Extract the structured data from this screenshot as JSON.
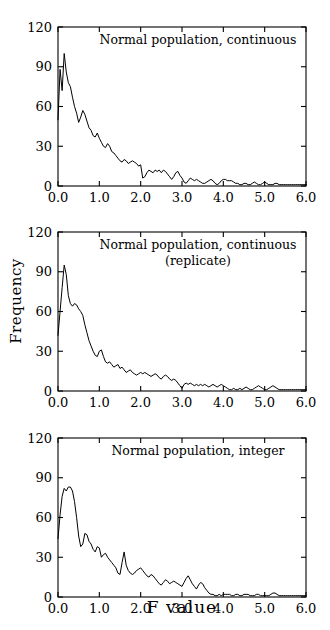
{
  "figure": {
    "xlabel": "F value",
    "ylabel": "Frequency"
  },
  "chart_data": [
    {
      "type": "line",
      "title": "Normal population, continuous",
      "subtitle": "",
      "xlabel": "F value",
      "ylabel": "Frequency",
      "xlim": [
        0.0,
        6.0
      ],
      "ylim": [
        0,
        120
      ],
      "xticks": [
        "0.0",
        "1.0",
        "2.0",
        "3.0",
        "4.0",
        "5.0",
        "6.0"
      ],
      "xtick_values": [
        0.0,
        1.0,
        2.0,
        3.0,
        4.0,
        5.0,
        6.0
      ],
      "yticks": [
        "0",
        "30",
        "60",
        "90",
        "120"
      ],
      "ytick_values": [
        0,
        30,
        60,
        90,
        120
      ],
      "grid": false,
      "legend": false,
      "x": [
        0.0,
        0.05,
        0.1,
        0.15,
        0.2,
        0.25,
        0.3,
        0.35,
        0.4,
        0.45,
        0.5,
        0.55,
        0.6,
        0.65,
        0.7,
        0.75,
        0.8,
        0.85,
        0.9,
        0.95,
        1.0,
        1.05,
        1.1,
        1.15,
        1.2,
        1.25,
        1.3,
        1.35,
        1.4,
        1.45,
        1.5,
        1.55,
        1.6,
        1.65,
        1.7,
        1.75,
        1.8,
        1.85,
        1.9,
        1.95,
        2.0,
        2.05,
        2.1,
        2.15,
        2.2,
        2.25,
        2.3,
        2.35,
        2.4,
        2.45,
        2.5,
        2.55,
        2.6,
        2.65,
        2.7,
        2.75,
        2.8,
        2.85,
        2.9,
        2.95,
        3.0,
        3.05,
        3.1,
        3.15,
        3.2,
        3.25,
        3.3,
        3.35,
        3.4,
        3.45,
        3.5,
        3.55,
        3.6,
        3.65,
        3.7,
        3.75,
        3.8,
        3.85,
        3.9,
        3.95,
        4.0,
        4.05,
        4.1,
        4.15,
        4.2,
        4.25,
        4.3,
        4.35,
        4.4,
        4.45,
        4.5,
        4.55,
        4.6,
        4.65,
        4.7,
        4.75,
        4.8,
        4.85,
        4.9,
        4.95,
        5.0,
        5.05,
        5.1,
        5.15,
        5.2,
        5.25,
        5.3,
        5.35,
        5.4,
        5.45,
        5.5,
        5.55,
        5.6,
        5.65,
        5.7,
        5.75,
        5.8,
        5.85,
        5.9,
        5.95,
        6.0
      ],
      "values": [
        50,
        88,
        72,
        100,
        86,
        78,
        75,
        67,
        60,
        55,
        48,
        52,
        57,
        54,
        49,
        44,
        42,
        38,
        37,
        40,
        36,
        33,
        30,
        29,
        32,
        30,
        26,
        25,
        23,
        21,
        19,
        18,
        20,
        19,
        17,
        18,
        19,
        18,
        17,
        15,
        16,
        6,
        7,
        10,
        12,
        11,
        10,
        12,
        11,
        12,
        10,
        12,
        11,
        9,
        7,
        5,
        7,
        10,
        11,
        8,
        6,
        3,
        2,
        4,
        6,
        5,
        4,
        5,
        4,
        3,
        2,
        2,
        3,
        4,
        5,
        4,
        2,
        1,
        2,
        4,
        5,
        5,
        4,
        4,
        4,
        3,
        2,
        2,
        1,
        1,
        2,
        2,
        1,
        1,
        2,
        3,
        2,
        1,
        1,
        2,
        3,
        2,
        1,
        1,
        1,
        2,
        2,
        1,
        1,
        1,
        1,
        1,
        1,
        1,
        1,
        1,
        1,
        1,
        1,
        1,
        1
      ]
    },
    {
      "type": "line",
      "title": "Normal population, continuous",
      "subtitle": "(replicate)",
      "xlabel": "F value",
      "ylabel": "Frequency",
      "xlim": [
        0.0,
        6.0
      ],
      "ylim": [
        0,
        120
      ],
      "xticks": [
        "0.0",
        "1.0",
        "2.0",
        "3.0",
        "4.0",
        "5.0",
        "6.0"
      ],
      "xtick_values": [
        0.0,
        1.0,
        2.0,
        3.0,
        4.0,
        5.0,
        6.0
      ],
      "yticks": [
        "0",
        "30",
        "60",
        "90",
        "120"
      ],
      "ytick_values": [
        0,
        30,
        60,
        90,
        120
      ],
      "grid": false,
      "legend": false,
      "x": [
        0.0,
        0.05,
        0.1,
        0.15,
        0.2,
        0.25,
        0.3,
        0.35,
        0.4,
        0.45,
        0.5,
        0.55,
        0.6,
        0.65,
        0.7,
        0.75,
        0.8,
        0.85,
        0.9,
        0.95,
        1.0,
        1.05,
        1.1,
        1.15,
        1.2,
        1.25,
        1.3,
        1.35,
        1.4,
        1.45,
        1.5,
        1.55,
        1.6,
        1.65,
        1.7,
        1.75,
        1.8,
        1.85,
        1.9,
        1.95,
        2.0,
        2.05,
        2.1,
        2.15,
        2.2,
        2.25,
        2.3,
        2.35,
        2.4,
        2.45,
        2.5,
        2.55,
        2.6,
        2.65,
        2.7,
        2.75,
        2.8,
        2.85,
        2.9,
        2.95,
        3.0,
        3.05,
        3.1,
        3.15,
        3.2,
        3.25,
        3.3,
        3.35,
        3.4,
        3.45,
        3.5,
        3.55,
        3.6,
        3.65,
        3.7,
        3.75,
        3.8,
        3.85,
        3.9,
        3.95,
        4.0,
        4.05,
        4.1,
        4.15,
        4.2,
        4.25,
        4.3,
        4.35,
        4.4,
        4.45,
        4.5,
        4.55,
        4.6,
        4.65,
        4.7,
        4.75,
        4.8,
        4.85,
        4.9,
        4.95,
        5.0,
        5.05,
        5.1,
        5.15,
        5.2,
        5.25,
        5.3,
        5.35,
        5.4,
        5.45,
        5.5,
        5.55,
        5.6,
        5.65,
        5.7,
        5.75,
        5.8,
        5.85,
        5.9,
        5.95,
        6.0
      ],
      "values": [
        42,
        60,
        78,
        95,
        88,
        72,
        66,
        64,
        66,
        65,
        62,
        60,
        57,
        50,
        44,
        38,
        34,
        30,
        27,
        26,
        30,
        31,
        26,
        22,
        21,
        22,
        20,
        18,
        19,
        20,
        17,
        18,
        16,
        14,
        15,
        16,
        14,
        13,
        12,
        13,
        14,
        13,
        14,
        13,
        12,
        11,
        12,
        13,
        12,
        10,
        9,
        11,
        12,
        11,
        9,
        8,
        9,
        8,
        6,
        4,
        2,
        5,
        6,
        5,
        6,
        5,
        4,
        5,
        4,
        5,
        4,
        5,
        4,
        3,
        4,
        5,
        4,
        3,
        4,
        5,
        4,
        3,
        2,
        1,
        1,
        2,
        1,
        1,
        2,
        1,
        2,
        3,
        2,
        1,
        1,
        2,
        3,
        4,
        3,
        2,
        1,
        1,
        2,
        3,
        4,
        3,
        2,
        1,
        1,
        1,
        1,
        1,
        1,
        1,
        1,
        1,
        1,
        1,
        1,
        1,
        1
      ]
    },
    {
      "type": "line",
      "title": "Normal population, integer",
      "subtitle": "",
      "xlabel": "F value",
      "ylabel": "Frequency",
      "xlim": [
        0.0,
        6.0
      ],
      "ylim": [
        0,
        120
      ],
      "xticks": [
        "0.0",
        "1.0",
        "2.0",
        "3.0",
        "4.0",
        "5.0",
        "6.0"
      ],
      "xtick_values": [
        0.0,
        1.0,
        2.0,
        3.0,
        4.0,
        5.0,
        6.0
      ],
      "yticks": [
        "0",
        "30",
        "60",
        "90",
        "120"
      ],
      "ytick_values": [
        0,
        30,
        60,
        90,
        120
      ],
      "grid": false,
      "legend": false,
      "x": [
        0.0,
        0.05,
        0.1,
        0.15,
        0.2,
        0.25,
        0.3,
        0.35,
        0.4,
        0.45,
        0.5,
        0.55,
        0.6,
        0.65,
        0.7,
        0.75,
        0.8,
        0.85,
        0.9,
        0.95,
        1.0,
        1.05,
        1.1,
        1.15,
        1.2,
        1.25,
        1.3,
        1.35,
        1.4,
        1.45,
        1.5,
        1.55,
        1.6,
        1.65,
        1.7,
        1.75,
        1.8,
        1.85,
        1.9,
        1.95,
        2.0,
        2.05,
        2.1,
        2.15,
        2.2,
        2.25,
        2.3,
        2.35,
        2.4,
        2.45,
        2.5,
        2.55,
        2.6,
        2.65,
        2.7,
        2.75,
        2.8,
        2.85,
        2.9,
        2.95,
        3.0,
        3.05,
        3.1,
        3.15,
        3.2,
        3.25,
        3.3,
        3.35,
        3.4,
        3.45,
        3.5,
        3.55,
        3.6,
        3.65,
        3.7,
        3.75,
        3.8,
        3.85,
        3.9,
        3.95,
        4.0,
        4.05,
        4.1,
        4.15,
        4.2,
        4.25,
        4.3,
        4.35,
        4.4,
        4.45,
        4.5,
        4.55,
        4.6,
        4.65,
        4.7,
        4.75,
        4.8,
        4.85,
        4.9,
        4.95,
        5.0,
        5.05,
        5.1,
        5.15,
        5.2,
        5.25,
        5.3,
        5.35,
        5.4,
        5.45,
        5.5,
        5.55,
        5.6,
        5.65,
        5.7,
        5.75,
        5.8,
        5.85,
        5.9,
        5.95,
        6.0
      ],
      "values": [
        44,
        62,
        76,
        82,
        80,
        83,
        83,
        80,
        72,
        60,
        46,
        38,
        40,
        48,
        47,
        42,
        40,
        36,
        34,
        38,
        37,
        30,
        32,
        33,
        30,
        28,
        26,
        24,
        22,
        18,
        17,
        26,
        34,
        24,
        20,
        18,
        17,
        18,
        20,
        21,
        22,
        20,
        18,
        16,
        15,
        17,
        16,
        14,
        12,
        10,
        9,
        11,
        13,
        12,
        10,
        11,
        12,
        11,
        10,
        9,
        8,
        11,
        14,
        16,
        13,
        10,
        8,
        6,
        9,
        11,
        10,
        7,
        5,
        3,
        2,
        2,
        1,
        1,
        2,
        1,
        2,
        2,
        2,
        2,
        1,
        1,
        2,
        2,
        1,
        1,
        2,
        2,
        2,
        1,
        1,
        1,
        2,
        2,
        1,
        1,
        1,
        1,
        1,
        2,
        3,
        3,
        2,
        1,
        1,
        1,
        1,
        1,
        1,
        1,
        1,
        1,
        1,
        1,
        1,
        1,
        1
      ]
    }
  ]
}
